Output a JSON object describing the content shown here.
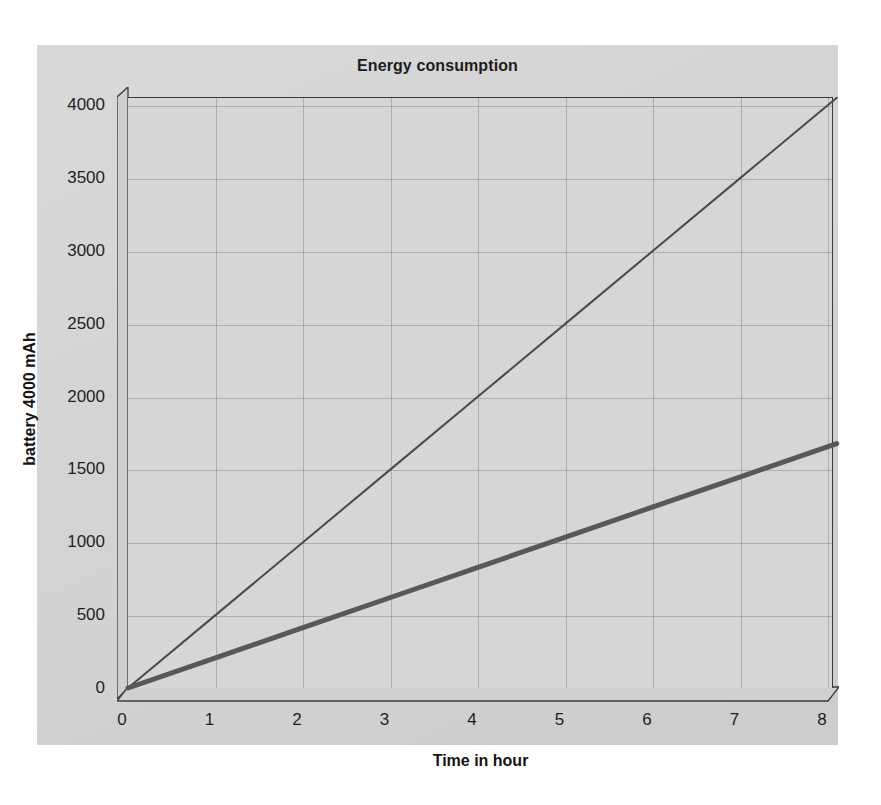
{
  "chart_data": {
    "type": "line",
    "title": "Energy consumption",
    "xlabel": "Time in hour",
    "ylabel": "battery 4000 mAh",
    "xlim": [
      0,
      8.1
    ],
    "ylim": [
      0,
      4100
    ],
    "xticks": [
      "0",
      "1",
      "2",
      "3",
      "4",
      "5",
      "6",
      "7",
      "8"
    ],
    "xtick_values": [
      0,
      1,
      2,
      3,
      4,
      5,
      6,
      7,
      8
    ],
    "yticks": [
      "0",
      "500",
      "1000",
      "1500",
      "2000",
      "2500",
      "3000",
      "3500",
      "4000"
    ],
    "ytick_values": [
      0,
      500,
      1000,
      1500,
      2000,
      2500,
      3000,
      3500,
      4000
    ],
    "grid": true,
    "legend": "none",
    "x": [
      0,
      1,
      2,
      3,
      4,
      5,
      6,
      7,
      8,
      8.1
    ],
    "series": [
      {
        "name": "high-consumption",
        "color": "#4a4a4a",
        "width": 2,
        "values": [
          0,
          500,
          1000,
          1500,
          2000,
          2500,
          3000,
          3500,
          4000,
          4050
        ]
      },
      {
        "name": "low-consumption",
        "color": "#585858",
        "width": 5,
        "values": [
          0,
          207,
          414,
          621,
          828,
          1035,
          1242,
          1449,
          1656,
          1677
        ]
      }
    ],
    "annotations": []
  },
  "figure": {
    "canvas_color": "#d3d3d3",
    "plot_bg_color": "#d6d6d6",
    "axis_color": "#3b3b3b",
    "grid_color": "#6e6e6e",
    "page_bg_color": "#ffffff",
    "projection": "3d-floor-and-left-wall"
  }
}
